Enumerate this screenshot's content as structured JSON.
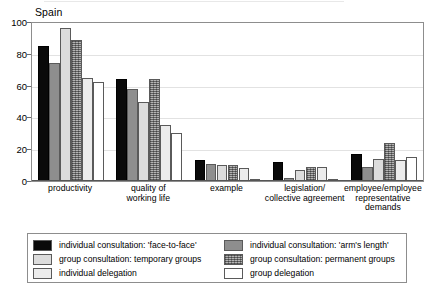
{
  "chart_data": {
    "type": "bar",
    "title": "Spain",
    "xlabel": "",
    "ylabel": "",
    "ylim": [
      0,
      100
    ],
    "yticks": [
      0,
      20,
      40,
      60,
      80,
      100
    ],
    "grid": true,
    "legend_position": "bottom",
    "categories": [
      "productivity",
      "quality of working life",
      "example",
      "legislation/ collective agreement",
      "employee/employee representative demands"
    ],
    "category_label_lines": [
      [
        "productivity"
      ],
      [
        "quality of",
        "working life"
      ],
      [
        "example"
      ],
      [
        "legislation/",
        "collective agreement"
      ],
      [
        "employee/employee",
        "representative",
        "demands"
      ]
    ],
    "series": [
      {
        "name": "individual consultation: 'face-to-face'",
        "swatch": "solid-black",
        "color": "#0a0a0a",
        "values": [
          85,
          64,
          13,
          12,
          17
        ]
      },
      {
        "name": "individual consultation: 'arm's length'",
        "swatch": "solid-mid-gray",
        "color": "#8e8e8e",
        "values": [
          74,
          58,
          11,
          2,
          9
        ]
      },
      {
        "name": "group consultation: temporary groups",
        "swatch": "solid-light-gray",
        "color": "#dcdcdc",
        "values": [
          96,
          50,
          10,
          7,
          14
        ]
      },
      {
        "name": "group consultation: permanent groups",
        "swatch": "crosshatch-gray",
        "color": "#b4b4b4",
        "values": [
          89,
          64,
          10,
          9,
          24
        ]
      },
      {
        "name": "individual delegation",
        "swatch": "solid-very-light-gray",
        "color": "#ececec",
        "values": [
          65,
          35,
          8,
          9,
          13
        ]
      },
      {
        "name": "group delegation",
        "swatch": "white",
        "color": "#ffffff",
        "values": [
          62,
          30,
          1,
          0,
          15
        ]
      }
    ]
  },
  "legend": {
    "left_column": [
      "individual consultation: 'face-to-face'",
      "group consultation: temporary groups",
      "individual delegation"
    ],
    "right_column": [
      "individual consultation: 'arm's length'",
      "group consultation: permanent groups",
      "group delegation"
    ]
  }
}
